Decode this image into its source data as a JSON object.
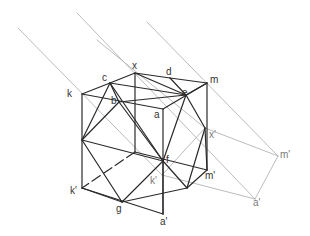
{
  "diagram": {
    "type": "geometric-construction",
    "colors": {
      "background": "#ffffff",
      "solid_edge": "#2a2a2a",
      "construction": "#b4b4b4",
      "label_dark": "#333333",
      "label_light": "#7a7a7a"
    },
    "points": {
      "x": [
        135,
        73
      ],
      "c": [
        110,
        83
      ],
      "d": [
        170,
        78
      ],
      "m": [
        207,
        83
      ],
      "k": [
        82,
        94
      ],
      "b": [
        119,
        102
      ],
      "e": [
        186,
        95
      ],
      "a": [
        163,
        109
      ],
      "L": [
        82,
        140
      ],
      "xp": [
        205,
        128
      ],
      "f": [
        163,
        161
      ],
      "H": [
        135,
        152
      ],
      "mp": [
        207,
        170
      ],
      "kp2": [
        162,
        175
      ],
      "kp": [
        82,
        188
      ],
      "R": [
        187,
        188
      ],
      "g": [
        122,
        202
      ],
      "ap": [
        163,
        214
      ],
      "mpp": [
        278,
        156
      ],
      "app": [
        255,
        199
      ]
    },
    "solid_edges": [
      [
        "k",
        "c"
      ],
      [
        "c",
        "x"
      ],
      [
        "x",
        "d"
      ],
      [
        "d",
        "m"
      ],
      [
        "k",
        "a"
      ],
      [
        "a",
        "m"
      ],
      [
        "c",
        "b"
      ],
      [
        "b",
        "e"
      ],
      [
        "e",
        "m"
      ],
      [
        "x",
        "e"
      ],
      [
        "c",
        "e"
      ],
      [
        "k",
        "kp"
      ],
      [
        "a",
        "ap"
      ],
      [
        "m",
        "mp"
      ],
      [
        "kp",
        "ap"
      ],
      [
        "x",
        "H"
      ],
      [
        "H",
        "mp"
      ],
      [
        "c",
        "L"
      ],
      [
        "b",
        "L"
      ],
      [
        "L",
        "g"
      ],
      [
        "L",
        "f"
      ],
      [
        "c",
        "f"
      ],
      [
        "b",
        "f"
      ],
      [
        "e",
        "f"
      ],
      [
        "e",
        "xp"
      ],
      [
        "d",
        "e"
      ],
      [
        "xp",
        "R"
      ],
      [
        "f",
        "R"
      ],
      [
        "kp",
        "g"
      ],
      [
        "g",
        "f"
      ],
      [
        "g",
        "R"
      ],
      [
        "f",
        "ap"
      ],
      [
        "R",
        "mp"
      ],
      [
        "xp",
        "mp"
      ]
    ],
    "dashed_edges": [
      [
        "H",
        "kp"
      ]
    ],
    "construction_lines": [
      [
        [
          18,
          28
        ],
        [
          162,
          175
        ]
      ],
      [
        [
          77,
          13
        ],
        [
          255,
          199
        ]
      ],
      [
        [
          97,
          40
        ],
        [
          205,
          128
        ]
      ],
      [
        [
          147,
          22
        ],
        [
          278,
          156
        ]
      ],
      [
        [
          205,
          128
        ],
        [
          278,
          156
        ]
      ],
      [
        [
          278,
          156
        ],
        [
          255,
          199
        ]
      ],
      [
        [
          162,
          175
        ],
        [
          255,
          199
        ]
      ],
      [
        [
          162,
          175
        ],
        [
          205,
          128
        ]
      ]
    ],
    "labels": [
      {
        "text": "x",
        "pos": [
          132,
          61
        ],
        "tone": "dark"
      },
      {
        "text": "c",
        "pos": [
          102,
          73
        ],
        "tone": "dark"
      },
      {
        "text": "d",
        "pos": [
          166,
          67
        ],
        "tone": "dark"
      },
      {
        "text": "m",
        "pos": [
          210,
          75
        ],
        "tone": "dark"
      },
      {
        "text": "k",
        "pos": [
          67,
          89
        ],
        "tone": "dark"
      },
      {
        "text": "b",
        "pos": [
          111,
          96
        ],
        "tone": "dark"
      },
      {
        "text": "e",
        "pos": [
          182,
          88
        ],
        "tone": "dark"
      },
      {
        "text": "a",
        "pos": [
          154,
          110
        ],
        "tone": "dark"
      },
      {
        "text": "x'",
        "pos": [
          209,
          130
        ],
        "tone": "light"
      },
      {
        "text": "f",
        "pos": [
          166,
          155
        ],
        "tone": "dark"
      },
      {
        "text": "m'",
        "pos": [
          205,
          171
        ],
        "tone": "dark"
      },
      {
        "text": "k'",
        "pos": [
          150,
          176
        ],
        "tone": "light"
      },
      {
        "text": "k'",
        "pos": [
          70,
          186
        ],
        "tone": "dark"
      },
      {
        "text": "g",
        "pos": [
          116,
          204
        ],
        "tone": "dark"
      },
      {
        "text": "a'",
        "pos": [
          160,
          217
        ],
        "tone": "dark"
      },
      {
        "text": "m'",
        "pos": [
          280,
          150
        ],
        "tone": "light"
      },
      {
        "text": "a'",
        "pos": [
          253,
          198
        ],
        "tone": "light"
      }
    ]
  }
}
